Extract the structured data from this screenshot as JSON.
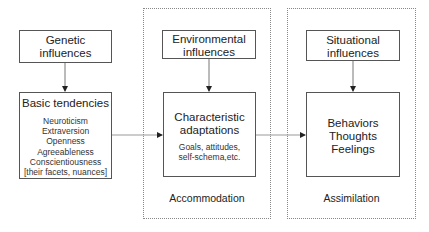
{
  "nodes": {
    "genetic": {
      "label_line1": "Genetic",
      "label_line2": "influences"
    },
    "basic": {
      "title": "Basic tendencies",
      "items": [
        "Neuroticism",
        "Extraversion",
        "Openness",
        "Agreeableness",
        "Conscientiousness",
        "[their facets, nuances]"
      ]
    },
    "environmental": {
      "label_line1": "Environmental",
      "label_line2": "influences"
    },
    "characteristic": {
      "title_line1": "Characteristic",
      "title_line2": "adaptations",
      "detail_line1": "Goals, attitudes,",
      "detail_line2": "self-schema,etc."
    },
    "situational": {
      "label_line1": "Situational",
      "label_line2": "influences"
    },
    "behaviors": {
      "line1": "Behaviors",
      "line2": "Thoughts",
      "line3": "Feelings"
    }
  },
  "panels": {
    "accommodation": {
      "label": "Accommodation"
    },
    "assimilation": {
      "label": "Assimilation"
    }
  },
  "edges": [
    {
      "from": "genetic",
      "to": "basic"
    },
    {
      "from": "environmental",
      "to": "characteristic"
    },
    {
      "from": "situational",
      "to": "behaviors"
    },
    {
      "from": "basic",
      "to": "characteristic"
    },
    {
      "from": "characteristic",
      "to": "behaviors"
    }
  ]
}
